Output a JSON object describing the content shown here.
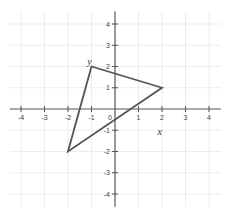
{
  "chart_data": {
    "type": "line",
    "title": "",
    "xlabel": "x",
    "ylabel": "y",
    "xlim": [
      -4.5,
      4.5
    ],
    "ylim": [
      -4.5,
      4.5
    ],
    "grid": true,
    "x_ticks": [
      -4,
      -3,
      -2,
      -1,
      0,
      1,
      2,
      3,
      4
    ],
    "y_ticks": [
      -4,
      -3,
      -2,
      -1,
      1,
      2,
      3,
      4
    ],
    "x_tick_labels": [
      "-4",
      "-3",
      "-2",
      "-1",
      "0",
      "1",
      "2",
      "3",
      "4"
    ],
    "y_tick_labels": [
      "-4",
      "-3",
      "-2",
      "-1",
      "1",
      "2",
      "3",
      "4"
    ],
    "series": [
      {
        "name": "triangle",
        "closed": true,
        "points": [
          [
            -1,
            2
          ],
          [
            2,
            1
          ],
          [
            -2,
            -2
          ]
        ],
        "color": "#555555"
      }
    ],
    "annotations": [
      {
        "text": "y",
        "at": [
          -1,
          2
        ],
        "position": "above-left"
      },
      {
        "text": "x",
        "at": [
          1.9,
          -1.1
        ],
        "position": "below"
      }
    ]
  },
  "layout": {
    "origin_px": [
      115,
      109
    ],
    "unit_x_px": 23.5,
    "unit_y_px": 21.25
  },
  "labels": {
    "x_axis_var": "x",
    "y_axis_var": "y"
  }
}
